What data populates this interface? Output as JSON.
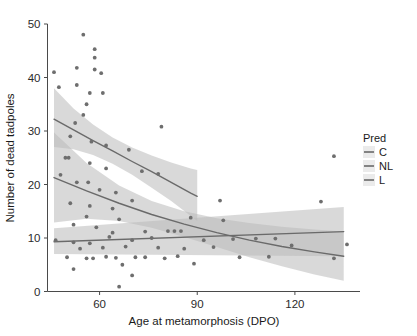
{
  "chart_data": {
    "type": "scatter",
    "title": "",
    "xlabel": "Age at metamorphosis (DPO)",
    "ylabel": "Number of dead tadpoles",
    "xlim": [
      44,
      140
    ],
    "ylim": [
      0,
      50
    ],
    "xticks": [
      60,
      90,
      120
    ],
    "xtick_labels": [
      "60",
      "90",
      "120"
    ],
    "yticks": [
      0,
      10,
      20,
      30,
      40,
      50
    ],
    "ytick_labels": [
      "0",
      "10",
      "20",
      "30",
      "40",
      "50"
    ],
    "grid": false,
    "legend": {
      "title": "Pred",
      "position": "right",
      "entries": [
        {
          "label": "C",
          "color": "#8c8c8c"
        },
        {
          "label": "NL",
          "color": "#9a9a9a"
        },
        {
          "label": "L",
          "color": "#8f8f8f"
        }
      ]
    },
    "point_color": "#6e6e6e",
    "ribbon_color": "#b9b9b9",
    "line_color": "#6a6a6a",
    "series": [
      {
        "name": "C",
        "label": "C",
        "fit": "curve",
        "color": "#8c8c8c",
        "fit_x": [
          46,
          52,
          58,
          64,
          70,
          76,
          82,
          88,
          90
        ],
        "fit_y": [
          32.2,
          30.2,
          28.2,
          26.3,
          24.3,
          22.4,
          20.4,
          18.4,
          17.8
        ],
        "band_lo": [
          27.0,
          26.6,
          25.5,
          23.9,
          21.8,
          19.4,
          16.9,
          14.1,
          13.2
        ],
        "band_hi": [
          38.0,
          34.2,
          31.2,
          28.8,
          26.9,
          25.4,
          24.1,
          23.0,
          22.7
        ],
        "points": [
          {
            "x": 47.5,
            "y": 38.1
          },
          {
            "x": 50.5,
            "y": 31.5
          },
          {
            "x": 53.5,
            "y": 29.0
          },
          {
            "x": 55.5,
            "y": 28.0
          },
          {
            "x": 58.5,
            "y": 27.6
          },
          {
            "x": 62.0,
            "y": 25.0
          },
          {
            "x": 66.0,
            "y": 23.5
          },
          {
            "x": 70.0,
            "y": 22.0
          },
          {
            "x": 73.0,
            "y": 20.0
          },
          {
            "x": 78.0,
            "y": 19.0
          },
          {
            "x": 82.0,
            "y": 18.0
          },
          {
            "x": 86.0,
            "y": 16.5
          }
        ]
      },
      {
        "name": "NL",
        "label": "NL",
        "fit": "curve",
        "color": "#9a9a9a",
        "fit_x": [
          46,
          56,
          66,
          76,
          86,
          96,
          106,
          116,
          126,
          135
        ],
        "fit_y": [
          21.3,
          18.8,
          16.5,
          14.4,
          12.6,
          11.0,
          9.6,
          8.4,
          7.4,
          6.6
        ],
        "band_lo": [
          12.9,
          13.6,
          13.2,
          11.9,
          10.2,
          8.3,
          6.4,
          4.7,
          3.2,
          2.0
        ],
        "band_hi": [
          29.7,
          24.0,
          19.8,
          16.9,
          15.0,
          13.7,
          12.8,
          12.1,
          11.6,
          11.2
        ],
        "points": [
          {
            "x": 47.0,
            "y": 22.0
          },
          {
            "x": 50.0,
            "y": 21.5
          },
          {
            "x": 54.0,
            "y": 17.0
          },
          {
            "x": 57.5,
            "y": 19.5
          },
          {
            "x": 60.0,
            "y": 18.5
          },
          {
            "x": 62.0,
            "y": 16.0
          },
          {
            "x": 66.0,
            "y": 14.0
          },
          {
            "x": 72.0,
            "y": 15.0
          },
          {
            "x": 78.0,
            "y": 13.0
          },
          {
            "x": 85.0,
            "y": 12.5
          },
          {
            "x": 92.0,
            "y": 11.5
          },
          {
            "x": 103.0,
            "y": 9.5
          },
          {
            "x": 112.0,
            "y": 8.0
          },
          {
            "x": 122.0,
            "y": 7.5
          },
          {
            "x": 131.0,
            "y": 6.5
          }
        ]
      },
      {
        "name": "L",
        "label": "L",
        "fit": "line",
        "color": "#8f8f8f",
        "fit_x": [
          46,
          135
        ],
        "fit_y": [
          9.3,
          11.2
        ],
        "band_lo": [
          7.0,
          6.6
        ],
        "band_hi": [
          11.8,
          15.8
        ],
        "points": [
          {
            "x": 46.5,
            "y": 9.4
          },
          {
            "x": 50.0,
            "y": 8.6
          },
          {
            "x": 53.0,
            "y": 11.2
          },
          {
            "x": 56.0,
            "y": 10.8
          },
          {
            "x": 59.0,
            "y": 9.0
          },
          {
            "x": 63.0,
            "y": 9.8
          },
          {
            "x": 68.0,
            "y": 10.0
          },
          {
            "x": 74.0,
            "y": 10.2
          },
          {
            "x": 80.0,
            "y": 10.0
          },
          {
            "x": 86.0,
            "y": 10.3
          },
          {
            "x": 95.0,
            "y": 10.5
          },
          {
            "x": 108.0,
            "y": 10.6
          },
          {
            "x": 118.0,
            "y": 10.8
          },
          {
            "x": 130.0,
            "y": 11.0
          }
        ]
      }
    ],
    "points": [
      {
        "x": 46.0,
        "y": 41.0
      },
      {
        "x": 55.0,
        "y": 48.0
      },
      {
        "x": 58.5,
        "y": 45.3
      },
      {
        "x": 58.5,
        "y": 43.7
      },
      {
        "x": 53.0,
        "y": 41.8
      },
      {
        "x": 58.5,
        "y": 41.5
      },
      {
        "x": 60.5,
        "y": 40.8
      },
      {
        "x": 47.5,
        "y": 38.2
      },
      {
        "x": 53.0,
        "y": 38.6
      },
      {
        "x": 57.0,
        "y": 37.1
      },
      {
        "x": 61.0,
        "y": 37.1
      },
      {
        "x": 56.0,
        "y": 35.0
      },
      {
        "x": 55.0,
        "y": 33.0
      },
      {
        "x": 52.5,
        "y": 31.5
      },
      {
        "x": 79.0,
        "y": 30.8
      },
      {
        "x": 51.0,
        "y": 29.0
      },
      {
        "x": 57.5,
        "y": 28.0
      },
      {
        "x": 62.0,
        "y": 27.3
      },
      {
        "x": 69.0,
        "y": 26.5
      },
      {
        "x": 132.0,
        "y": 25.3
      },
      {
        "x": 49.5,
        "y": 25.0
      },
      {
        "x": 50.5,
        "y": 25.0
      },
      {
        "x": 57.0,
        "y": 24.0
      },
      {
        "x": 62.0,
        "y": 23.0
      },
      {
        "x": 73.0,
        "y": 22.5
      },
      {
        "x": 78.0,
        "y": 22.0
      },
      {
        "x": 48.0,
        "y": 21.8
      },
      {
        "x": 53.0,
        "y": 20.4
      },
      {
        "x": 56.5,
        "y": 20.4
      },
      {
        "x": 60.0,
        "y": 19.0
      },
      {
        "x": 65.0,
        "y": 18.5
      },
      {
        "x": 70.0,
        "y": 17.0
      },
      {
        "x": 97.0,
        "y": 17.0
      },
      {
        "x": 51.0,
        "y": 16.5
      },
      {
        "x": 57.0,
        "y": 16.0
      },
      {
        "x": 64.0,
        "y": 15.5
      },
      {
        "x": 128.0,
        "y": 16.8
      },
      {
        "x": 56.0,
        "y": 14.0
      },
      {
        "x": 66.0,
        "y": 13.5
      },
      {
        "x": 88.0,
        "y": 13.8
      },
      {
        "x": 98.0,
        "y": 13.3
      },
      {
        "x": 52.0,
        "y": 12.5
      },
      {
        "x": 59.0,
        "y": 12.0
      },
      {
        "x": 64.0,
        "y": 11.0
      },
      {
        "x": 74.0,
        "y": 11.2
      },
      {
        "x": 81.0,
        "y": 11.3
      },
      {
        "x": 83.0,
        "y": 11.3
      },
      {
        "x": 85.0,
        "y": 11.3
      },
      {
        "x": 46.5,
        "y": 9.6
      },
      {
        "x": 52.0,
        "y": 9.2
      },
      {
        "x": 57.0,
        "y": 9.0
      },
      {
        "x": 63.0,
        "y": 10.2
      },
      {
        "x": 70.0,
        "y": 9.6
      },
      {
        "x": 76.0,
        "y": 10.0
      },
      {
        "x": 92.0,
        "y": 9.6
      },
      {
        "x": 101.0,
        "y": 9.8
      },
      {
        "x": 108.0,
        "y": 9.9
      },
      {
        "x": 114.0,
        "y": 9.9
      },
      {
        "x": 54.0,
        "y": 8.0
      },
      {
        "x": 61.0,
        "y": 8.2
      },
      {
        "x": 68.0,
        "y": 8.4
      },
      {
        "x": 78.0,
        "y": 8.2
      },
      {
        "x": 86.0,
        "y": 8.0
      },
      {
        "x": 95.0,
        "y": 8.3
      },
      {
        "x": 119.0,
        "y": 8.6
      },
      {
        "x": 136.0,
        "y": 8.8
      },
      {
        "x": 50.0,
        "y": 6.4
      },
      {
        "x": 56.0,
        "y": 6.2
      },
      {
        "x": 58.0,
        "y": 6.2
      },
      {
        "x": 62.0,
        "y": 6.5
      },
      {
        "x": 65.0,
        "y": 6.3
      },
      {
        "x": 71.0,
        "y": 6.4
      },
      {
        "x": 74.0,
        "y": 6.4
      },
      {
        "x": 80.0,
        "y": 6.2
      },
      {
        "x": 84.0,
        "y": 6.6
      },
      {
        "x": 103.0,
        "y": 6.4
      },
      {
        "x": 112.0,
        "y": 6.5
      },
      {
        "x": 132.0,
        "y": 6.2
      },
      {
        "x": 67.0,
        "y": 5.0
      },
      {
        "x": 89.0,
        "y": 5.2
      },
      {
        "x": 52.0,
        "y": 4.2
      },
      {
        "x": 70.0,
        "y": 3.0
      },
      {
        "x": 66.0,
        "y": 0.9
      }
    ]
  }
}
